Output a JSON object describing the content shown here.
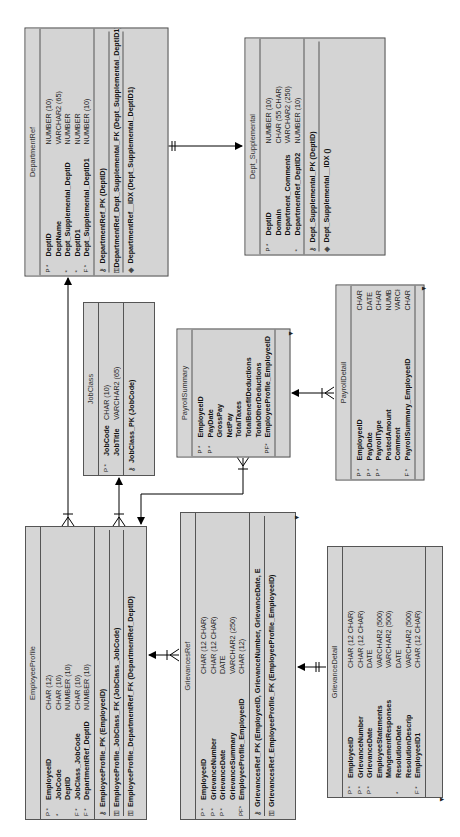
{
  "diagram_title": "Relational model",
  "tables": {
    "department_ref": {
      "name": "DepartmentRef",
      "columns": [
        {
          "flag": "P *",
          "name": "DeptID",
          "type": "NUMBER (10)"
        },
        {
          "flag": "",
          "name": "DeptName",
          "type": "VARCHAR2 (65)"
        },
        {
          "flag": "*",
          "name": "Dept_Supplemental_DeptID",
          "type": "NUMBER"
        },
        {
          "flag": "*",
          "name": "DeptID1",
          "type": "NUMBER"
        },
        {
          "flag": "F *",
          "name": "Dept_Supplemental_DeptID1",
          "type": "NUMBER (10)"
        }
      ],
      "keys": [
        {
          "icon": "pk-key-icon",
          "glyph": "⚷",
          "label": "DepartmentRef_PK (DeptID)"
        },
        {
          "icon": "fk-key-icon",
          "glyph": "⚿",
          "label": "DepartmentRef_Dept_Supplemental_FK (Dept_Supplemental_DeptID1)"
        },
        {
          "icon": "index-icon",
          "glyph": "◈",
          "label": "DepartmentRef__IDX (Dept_Supplemental_DeptID1)"
        }
      ]
    },
    "dept_supplemental": {
      "name": "Dept_Supplemental",
      "columns": [
        {
          "flag": "P *",
          "name": "DeptID",
          "type": "NUMBER (10)"
        },
        {
          "flag": "",
          "name": "Domain",
          "type": "CHAR (55 CHAR)"
        },
        {
          "flag": "",
          "name": "Department_Comments",
          "type": "VARCHAR2 (250)"
        },
        {
          "flag": "*",
          "name": "DepartmentRef_DeptID2",
          "type": "NUMBER (10)"
        }
      ],
      "keys": [
        {
          "icon": "pk-key-icon",
          "glyph": "⚷",
          "label": "Dept_Supplemental_PK (DeptID)"
        },
        {
          "icon": "index-icon",
          "glyph": "◈",
          "label": "Dept_Supplemental__IDX ()"
        }
      ]
    },
    "job_class": {
      "name": "JobClass",
      "columns": [
        {
          "flag": "P *",
          "name": "JobCode",
          "type": "CHAR (10)"
        },
        {
          "flag": "",
          "name": "JobTitle",
          "type": "VARCHAR2 (65)"
        }
      ],
      "keys": [
        {
          "icon": "pk-key-icon",
          "glyph": "⚷",
          "label": "JobClass_PK (JobCode)"
        }
      ]
    },
    "payroll_summary": {
      "name": "PayrollSummary",
      "columns": [
        {
          "flag": "P *",
          "name": "EmployeeID",
          "type": ""
        },
        {
          "flag": "P *",
          "name": "PayDate",
          "type": ""
        },
        {
          "flag": "",
          "name": "GrossPay",
          "type": ""
        },
        {
          "flag": "",
          "name": "NetPay",
          "type": ""
        },
        {
          "flag": "",
          "name": "TotalTaxes",
          "type": ""
        },
        {
          "flag": "",
          "name": "TotalBenefitDeductions",
          "type": ""
        },
        {
          "flag": "",
          "name": "TotalOtherDeductions",
          "type": ""
        },
        {
          "flag": "PF*",
          "name": "EmployeeProfile_EmployeeID",
          "type": ""
        }
      ],
      "keys": []
    },
    "payroll_detail": {
      "name": "PayrollDetail",
      "columns": [
        {
          "flag": "P *",
          "name": "EmployeeID",
          "type": "CHAR ("
        },
        {
          "flag": "P *",
          "name": "PayDate",
          "type": "DATE"
        },
        {
          "flag": "P *",
          "name": "PayrollType",
          "type": "CHAR ("
        },
        {
          "flag": "",
          "name": "PostedAmount",
          "type": "NUMBE"
        },
        {
          "flag": "",
          "name": "Comment",
          "type": "VARCH"
        },
        {
          "flag": "F *",
          "name": "PayrollSummary_EmployeeID",
          "type": "CHAR"
        }
      ],
      "keys": []
    },
    "employee_profile": {
      "name": "EmployeeProfile",
      "columns": [
        {
          "flag": "P *",
          "name": "EmployeeID",
          "type": "CHAR (12)"
        },
        {
          "flag": "*",
          "name": "JobCode",
          "type": "CHAR (10)"
        },
        {
          "flag": "",
          "name": "DeptID",
          "type": "NUMBER (10)"
        },
        {
          "flag": "F *",
          "name": "JobClass_JobCode",
          "type": "CHAR (10)"
        },
        {
          "flag": "F *",
          "name": "DepartmentRef_DeptID",
          "type": "NUMBER (10)"
        }
      ],
      "keys": [
        {
          "icon": "pk-key-icon",
          "glyph": "⚷",
          "label": "EmployeeProfile_PK (EmployeeID)"
        },
        {
          "icon": "fk-key-icon",
          "glyph": "⚿",
          "label": "EmployeeProfile_JobClass_FK (JobClass_JobCode)"
        },
        {
          "icon": "fk-key-icon",
          "glyph": "⚿",
          "label": "EmployeeProfile_DepartmentRef_FK (DepartmentRef_DeptID)"
        }
      ]
    },
    "grievances_ref": {
      "name": "GrievancesRef",
      "columns": [
        {
          "flag": "P *",
          "name": "EmployeeID",
          "type": "CHAR (12 CHAR)"
        },
        {
          "flag": "P *",
          "name": "GrievanceNumber",
          "type": "CHAR (12 CHAR)"
        },
        {
          "flag": "P *",
          "name": "GrievanceDate",
          "type": "DATE"
        },
        {
          "flag": "",
          "name": "GrievanceSummary",
          "type": "VARCHAR2 (250)"
        },
        {
          "flag": "PF*",
          "name": "EmployeeProfile_EmployeeID",
          "type": "CHAR (12)"
        }
      ],
      "keys": [
        {
          "icon": "pk-key-icon",
          "glyph": "⚷",
          "label": "GrievancesRef_PK (EmployeeID, GrievanceNumber, GrievanceDate, E"
        },
        {
          "icon": "fk-key-icon",
          "glyph": "⚿",
          "label": "GrievancesRef_EmployeeProfile_FK (EmployeeProfile_EmployeeID)"
        }
      ]
    },
    "grievance_detail": {
      "name": "GrievanceDetail",
      "columns": [
        {
          "flag": "P *",
          "name": "EmployeeID",
          "type": "CHAR (12 CHAR)"
        },
        {
          "flag": "P *",
          "name": "GrievanceNumber",
          "type": "CHAR (12 CHAR)"
        },
        {
          "flag": "P *",
          "name": "GrievanceDate",
          "type": "DATE"
        },
        {
          "flag": "",
          "name": "EmployeeStatements",
          "type": "VARCHAR2 (500)"
        },
        {
          "flag": "",
          "name": "MangementResponses",
          "type": "VARCHAR2 (500)"
        },
        {
          "flag": "*",
          "name": "ResolutionDate",
          "type": "DATE"
        },
        {
          "flag": "",
          "name": "ResolutionDescrip",
          "type": "VARCHAR2 (500)"
        },
        {
          "flag": "F *",
          "name": "EmployeeID1",
          "type": "CHAR (12 CHAR)"
        }
      ],
      "keys": []
    }
  }
}
